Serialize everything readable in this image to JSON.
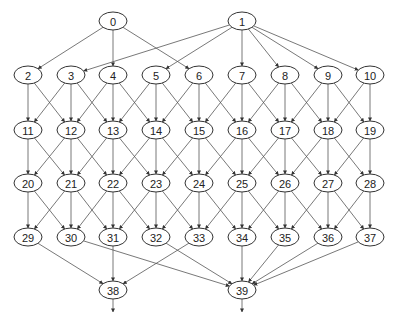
{
  "diagram": {
    "type": "directed-acyclic-graph",
    "width": 393,
    "height": 320,
    "node_rx": 14,
    "node_ry": 9,
    "colors": {
      "stroke": "#333333",
      "edge": "#555555",
      "text": "#222222",
      "fill": "#ffffff"
    },
    "nodes": [
      {
        "id": "0",
        "x": 113,
        "y": 21
      },
      {
        "id": "1",
        "x": 242,
        "y": 21
      },
      {
        "id": "2",
        "x": 28,
        "y": 75
      },
      {
        "id": "3",
        "x": 71,
        "y": 75
      },
      {
        "id": "4",
        "x": 113,
        "y": 75
      },
      {
        "id": "5",
        "x": 156,
        "y": 75
      },
      {
        "id": "6",
        "x": 199,
        "y": 75
      },
      {
        "id": "7",
        "x": 242,
        "y": 75
      },
      {
        "id": "8",
        "x": 285,
        "y": 75
      },
      {
        "id": "9",
        "x": 328,
        "y": 75
      },
      {
        "id": "10",
        "x": 370,
        "y": 75
      },
      {
        "id": "11",
        "x": 28,
        "y": 130
      },
      {
        "id": "12",
        "x": 71,
        "y": 130
      },
      {
        "id": "13",
        "x": 113,
        "y": 130
      },
      {
        "id": "14",
        "x": 156,
        "y": 130
      },
      {
        "id": "15",
        "x": 199,
        "y": 130
      },
      {
        "id": "16",
        "x": 242,
        "y": 130
      },
      {
        "id": "17",
        "x": 285,
        "y": 130
      },
      {
        "id": "18",
        "x": 328,
        "y": 130
      },
      {
        "id": "19",
        "x": 370,
        "y": 130
      },
      {
        "id": "20",
        "x": 28,
        "y": 183
      },
      {
        "id": "21",
        "x": 71,
        "y": 183
      },
      {
        "id": "22",
        "x": 113,
        "y": 183
      },
      {
        "id": "23",
        "x": 156,
        "y": 183
      },
      {
        "id": "24",
        "x": 199,
        "y": 183
      },
      {
        "id": "25",
        "x": 242,
        "y": 183
      },
      {
        "id": "26",
        "x": 285,
        "y": 183
      },
      {
        "id": "27",
        "x": 328,
        "y": 183
      },
      {
        "id": "28",
        "x": 370,
        "y": 183
      },
      {
        "id": "29",
        "x": 28,
        "y": 237
      },
      {
        "id": "30",
        "x": 71,
        "y": 237
      },
      {
        "id": "31",
        "x": 113,
        "y": 237
      },
      {
        "id": "32",
        "x": 156,
        "y": 237
      },
      {
        "id": "33",
        "x": 199,
        "y": 237
      },
      {
        "id": "34",
        "x": 242,
        "y": 237
      },
      {
        "id": "35",
        "x": 285,
        "y": 237
      },
      {
        "id": "36",
        "x": 328,
        "y": 237
      },
      {
        "id": "37",
        "x": 370,
        "y": 237
      },
      {
        "id": "38",
        "x": 113,
        "y": 290
      },
      {
        "id": "39",
        "x": 242,
        "y": 290
      }
    ],
    "edges": [
      [
        "0",
        "2"
      ],
      [
        "0",
        "4"
      ],
      [
        "0",
        "6"
      ],
      [
        "1",
        "3"
      ],
      [
        "1",
        "5"
      ],
      [
        "1",
        "7"
      ],
      [
        "1",
        "8"
      ],
      [
        "1",
        "9"
      ],
      [
        "1",
        "10"
      ],
      [
        "2",
        "11"
      ],
      [
        "2",
        "12"
      ],
      [
        "3",
        "11"
      ],
      [
        "3",
        "12"
      ],
      [
        "3",
        "13"
      ],
      [
        "4",
        "12"
      ],
      [
        "4",
        "13"
      ],
      [
        "4",
        "14"
      ],
      [
        "5",
        "13"
      ],
      [
        "5",
        "14"
      ],
      [
        "5",
        "15"
      ],
      [
        "6",
        "14"
      ],
      [
        "6",
        "15"
      ],
      [
        "6",
        "16"
      ],
      [
        "7",
        "15"
      ],
      [
        "7",
        "16"
      ],
      [
        "7",
        "17"
      ],
      [
        "8",
        "16"
      ],
      [
        "8",
        "17"
      ],
      [
        "8",
        "18"
      ],
      [
        "9",
        "17"
      ],
      [
        "9",
        "18"
      ],
      [
        "9",
        "19"
      ],
      [
        "10",
        "18"
      ],
      [
        "10",
        "19"
      ],
      [
        "11",
        "20"
      ],
      [
        "11",
        "21"
      ],
      [
        "12",
        "20"
      ],
      [
        "12",
        "21"
      ],
      [
        "12",
        "22"
      ],
      [
        "13",
        "21"
      ],
      [
        "13",
        "22"
      ],
      [
        "13",
        "23"
      ],
      [
        "14",
        "22"
      ],
      [
        "14",
        "23"
      ],
      [
        "14",
        "24"
      ],
      [
        "15",
        "23"
      ],
      [
        "15",
        "24"
      ],
      [
        "15",
        "25"
      ],
      [
        "16",
        "24"
      ],
      [
        "16",
        "25"
      ],
      [
        "16",
        "26"
      ],
      [
        "17",
        "25"
      ],
      [
        "17",
        "26"
      ],
      [
        "17",
        "27"
      ],
      [
        "18",
        "26"
      ],
      [
        "18",
        "27"
      ],
      [
        "18",
        "28"
      ],
      [
        "19",
        "27"
      ],
      [
        "19",
        "28"
      ],
      [
        "20",
        "29"
      ],
      [
        "20",
        "30"
      ],
      [
        "21",
        "29"
      ],
      [
        "21",
        "30"
      ],
      [
        "21",
        "31"
      ],
      [
        "22",
        "30"
      ],
      [
        "22",
        "31"
      ],
      [
        "22",
        "32"
      ],
      [
        "23",
        "31"
      ],
      [
        "23",
        "32"
      ],
      [
        "23",
        "33"
      ],
      [
        "24",
        "32"
      ],
      [
        "24",
        "33"
      ],
      [
        "24",
        "34"
      ],
      [
        "25",
        "33"
      ],
      [
        "25",
        "34"
      ],
      [
        "25",
        "35"
      ],
      [
        "26",
        "34"
      ],
      [
        "26",
        "35"
      ],
      [
        "26",
        "36"
      ],
      [
        "27",
        "35"
      ],
      [
        "27",
        "36"
      ],
      [
        "27",
        "37"
      ],
      [
        "28",
        "36"
      ],
      [
        "28",
        "37"
      ],
      [
        "29",
        "38"
      ],
      [
        "31",
        "38"
      ],
      [
        "33",
        "38"
      ],
      [
        "30",
        "39"
      ],
      [
        "32",
        "39"
      ],
      [
        "34",
        "39"
      ],
      [
        "35",
        "39"
      ],
      [
        "36",
        "39"
      ],
      [
        "37",
        "39"
      ]
    ],
    "exit_arrows": [
      {
        "from": "38",
        "x": 113,
        "y1": 299,
        "y2": 312
      },
      {
        "from": "39",
        "x": 242,
        "y1": 299,
        "y2": 312
      }
    ]
  }
}
